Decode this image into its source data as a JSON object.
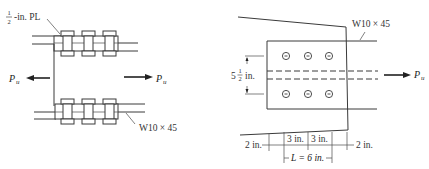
{
  "figure": {
    "left_view": {
      "plate_label": {
        "fraction_num": "1",
        "fraction_den": "2",
        "text": "-in. PL"
      },
      "member_label": "W10 × 45",
      "load_left": {
        "symbol": "P",
        "subscript": "u",
        "direction": "left"
      },
      "load_right": {
        "symbol": "P",
        "subscript": "u",
        "direction": "right"
      },
      "bolt_columns_per_flange": 3
    },
    "right_view": {
      "member_label": "W10 × 45",
      "load": {
        "symbol": "P",
        "subscript": "u",
        "direction": "right"
      },
      "gage_dimension": {
        "whole": "5",
        "fraction_num": "1",
        "fraction_den": "2",
        "unit": "in."
      },
      "bolt_rows": 2,
      "bolts_per_row": 3,
      "dimensions": {
        "edge_left": "2 in.",
        "spacing_1": "3 in.",
        "spacing_2": "3 in.",
        "edge_right": "2 in.",
        "length": "L = 6 in."
      }
    }
  }
}
